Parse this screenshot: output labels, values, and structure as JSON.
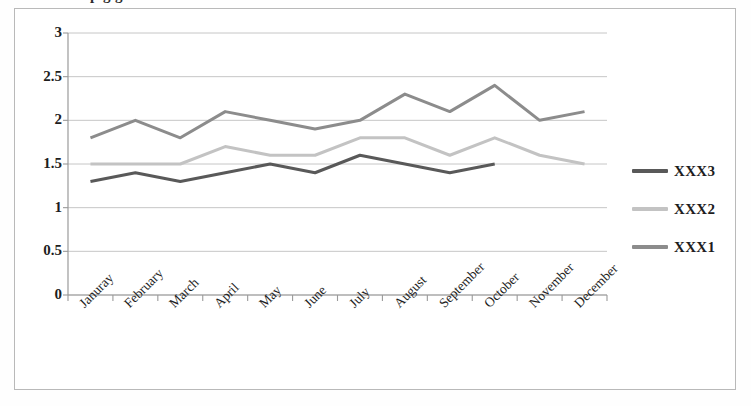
{
  "title_fragment": "p                       g                        g",
  "legend": {
    "items": [
      {
        "label": "XXX3",
        "color": "#595959"
      },
      {
        "label": "XXX2",
        "color": "#c3c3c3"
      },
      {
        "label": "XXX1",
        "color": "#8c8c8c"
      }
    ]
  },
  "axis": {
    "y_ticks": [
      "3",
      "2.5",
      "2",
      "1.5",
      "1",
      "0.5",
      "0"
    ]
  },
  "chart_data": {
    "type": "line",
    "title": "",
    "xlabel": "",
    "ylabel": "",
    "ylim": [
      0,
      3
    ],
    "ytick_step": 0.5,
    "grid": true,
    "legend_position": "right",
    "categories": [
      "Januray",
      "February",
      "March",
      "April",
      "May",
      "June",
      "July",
      "August",
      "September",
      "October",
      "November",
      "December"
    ],
    "series": [
      {
        "name": "XXX1",
        "color": "#8c8c8c",
        "values": [
          1.8,
          2.0,
          1.8,
          2.1,
          2.0,
          1.9,
          2.0,
          2.3,
          2.1,
          2.4,
          2.0,
          2.1
        ]
      },
      {
        "name": "XXX2",
        "color": "#c3c3c3",
        "values": [
          1.5,
          1.5,
          1.5,
          1.7,
          1.6,
          1.6,
          1.8,
          1.8,
          1.6,
          1.8,
          1.6,
          1.5
        ]
      },
      {
        "name": "XXX3",
        "color": "#595959",
        "values": [
          1.3,
          1.4,
          1.3,
          1.4,
          1.5,
          1.4,
          1.6,
          1.5,
          1.4,
          1.5,
          null,
          null
        ]
      }
    ]
  }
}
